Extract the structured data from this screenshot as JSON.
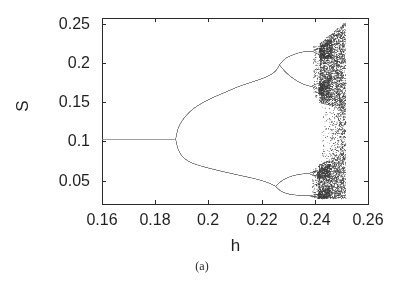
{
  "figure": {
    "caption": "(a)"
  },
  "chart_data": {
    "type": "scatter",
    "subtype": "bifurcation-diagram",
    "title": "",
    "xlabel": "h",
    "ylabel": "S",
    "xlim": [
      0.16,
      0.26
    ],
    "ylim": [
      0.02,
      0.258
    ],
    "grid": false,
    "legend": null,
    "xticks": [
      {
        "value": 0.16,
        "label": "0.16"
      },
      {
        "value": 0.18,
        "label": "0.18"
      },
      {
        "value": 0.2,
        "label": "0.2"
      },
      {
        "value": 0.22,
        "label": "0.22"
      },
      {
        "value": 0.24,
        "label": "0.24"
      },
      {
        "value": 0.26,
        "label": "0.26"
      }
    ],
    "yticks": [
      {
        "value": 0.05,
        "label": "0.05"
      },
      {
        "value": 0.1,
        "label": "0.1"
      },
      {
        "value": 0.15,
        "label": "0.15"
      },
      {
        "value": 0.2,
        "label": "0.2"
      },
      {
        "value": 0.25,
        "label": "0.25"
      }
    ],
    "plot_area_px": {
      "left": 102,
      "top": 18,
      "right": 368,
      "bottom": 204
    },
    "tick_length_px": 4,
    "annotations": {
      "first_bifurcation_h": 0.1877,
      "second_bifurcation_upper_h": 0.2267,
      "second_bifurcation_lower_h": 0.2253,
      "chaos_onset_h": 0.2415,
      "data_end_h": 0.2516,
      "period1_S": 0.103
    },
    "branches": [
      {
        "name": "period-1",
        "points": [
          [
            0.16,
            0.103
          ],
          [
            0.1877,
            0.103
          ]
        ]
      },
      {
        "name": "period-2-upper",
        "points": [
          [
            0.1877,
            0.103
          ],
          [
            0.1883,
            0.114
          ],
          [
            0.1892,
            0.1215
          ],
          [
            0.1905,
            0.1285
          ],
          [
            0.1925,
            0.1365
          ],
          [
            0.1945,
            0.1425
          ],
          [
            0.197,
            0.148
          ],
          [
            0.2,
            0.1535
          ],
          [
            0.2035,
            0.159
          ],
          [
            0.207,
            0.1638
          ],
          [
            0.211,
            0.17
          ],
          [
            0.215,
            0.1745
          ],
          [
            0.219,
            0.179
          ],
          [
            0.2225,
            0.1835
          ],
          [
            0.2245,
            0.1878
          ],
          [
            0.2258,
            0.192
          ],
          [
            0.2267,
            0.198
          ]
        ]
      },
      {
        "name": "period-2-lower",
        "points": [
          [
            0.1877,
            0.103
          ],
          [
            0.1883,
            0.0925
          ],
          [
            0.1892,
            0.0855
          ],
          [
            0.1905,
            0.0795
          ],
          [
            0.1925,
            0.0745
          ],
          [
            0.1943,
            0.0717
          ],
          [
            0.197,
            0.0688
          ],
          [
            0.2,
            0.066
          ],
          [
            0.2035,
            0.063
          ],
          [
            0.207,
            0.0603
          ],
          [
            0.211,
            0.0572
          ],
          [
            0.215,
            0.0543
          ],
          [
            0.219,
            0.0512
          ],
          [
            0.2225,
            0.0473
          ],
          [
            0.2243,
            0.0444
          ],
          [
            0.2253,
            0.0425
          ]
        ]
      },
      {
        "name": "period-4-upper-bubble-top",
        "points": [
          [
            0.2267,
            0.198
          ],
          [
            0.228,
            0.2035
          ],
          [
            0.2295,
            0.2075
          ],
          [
            0.2315,
            0.2105
          ],
          [
            0.2335,
            0.213
          ],
          [
            0.2355,
            0.2147
          ],
          [
            0.2375,
            0.2155
          ],
          [
            0.2392,
            0.2152
          ]
        ]
      },
      {
        "name": "period-4-upper-bubble-bottom",
        "points": [
          [
            0.2267,
            0.198
          ],
          [
            0.228,
            0.1925
          ],
          [
            0.2295,
            0.187
          ],
          [
            0.2315,
            0.1815
          ],
          [
            0.2335,
            0.177
          ],
          [
            0.2355,
            0.1735
          ],
          [
            0.2375,
            0.1712
          ],
          [
            0.2388,
            0.1705
          ]
        ]
      },
      {
        "name": "period-8-uu-up",
        "points": [
          [
            0.2392,
            0.2152
          ],
          [
            0.2408,
            0.218
          ],
          [
            0.2422,
            0.2192
          ]
        ]
      },
      {
        "name": "period-8-uu-down",
        "points": [
          [
            0.2392,
            0.2152
          ],
          [
            0.2408,
            0.2122
          ],
          [
            0.2422,
            0.2105
          ]
        ]
      },
      {
        "name": "period-8-ul-up",
        "points": [
          [
            0.2388,
            0.1705
          ],
          [
            0.2403,
            0.1733
          ],
          [
            0.2418,
            0.1748
          ]
        ]
      },
      {
        "name": "period-8-ul-down",
        "points": [
          [
            0.2388,
            0.1705
          ],
          [
            0.2403,
            0.1678
          ],
          [
            0.2418,
            0.1665
          ]
        ]
      },
      {
        "name": "period-4-lower-bubble-top",
        "points": [
          [
            0.2253,
            0.0425
          ],
          [
            0.2268,
            0.0478
          ],
          [
            0.2285,
            0.0518
          ],
          [
            0.2305,
            0.0548
          ],
          [
            0.2325,
            0.0568
          ],
          [
            0.2345,
            0.0581
          ],
          [
            0.2362,
            0.0588
          ],
          [
            0.2378,
            0.059
          ]
        ]
      },
      {
        "name": "period-4-lower-bubble-bottom",
        "points": [
          [
            0.2253,
            0.0425
          ],
          [
            0.2268,
            0.0372
          ],
          [
            0.2285,
            0.0343
          ],
          [
            0.2305,
            0.0325
          ],
          [
            0.2325,
            0.0315
          ],
          [
            0.2345,
            0.0309
          ],
          [
            0.2362,
            0.0306
          ],
          [
            0.2378,
            0.0305
          ]
        ]
      },
      {
        "name": "period-8-lu-up",
        "points": [
          [
            0.2378,
            0.059
          ],
          [
            0.2393,
            0.0612
          ],
          [
            0.2408,
            0.0623
          ]
        ]
      },
      {
        "name": "period-8-lu-down",
        "points": [
          [
            0.2378,
            0.059
          ],
          [
            0.2393,
            0.0568
          ],
          [
            0.2408,
            0.0557
          ]
        ]
      },
      {
        "name": "period-8-ll-up",
        "points": [
          [
            0.2378,
            0.0305
          ],
          [
            0.2393,
            0.0316
          ],
          [
            0.2408,
            0.0322
          ]
        ]
      },
      {
        "name": "period-8-ll-down",
        "points": [
          [
            0.2378,
            0.0305
          ],
          [
            0.2393,
            0.0296
          ],
          [
            0.2408,
            0.0291
          ]
        ]
      }
    ],
    "chaos_bands": [
      {
        "name": "upper-main",
        "h": [
          0.2418,
          0.2516
        ],
        "s_lo": [
          0.15,
          0.1395
        ],
        "s_hi": [
          0.2255,
          0.2525
        ],
        "points": 2700,
        "ramp": false
      },
      {
        "name": "lower-main",
        "h": [
          0.2415,
          0.2516
        ],
        "s_lo": [
          0.0275,
          0.0262
        ],
        "s_hi": [
          0.07,
          0.086
        ],
        "points": 1500,
        "ramp": false
      },
      {
        "name": "middle-sparse",
        "h": [
          0.2425,
          0.2516
        ],
        "s_lo": [
          0.07,
          0.086
        ],
        "s_hi": [
          0.15,
          0.1395
        ],
        "points": 1050,
        "ramp": true
      },
      {
        "name": "upper-spray",
        "h": [
          0.2395,
          0.2425
        ],
        "s_lo": [
          0.158,
          0.152
        ],
        "s_hi": [
          0.221,
          0.2255
        ],
        "points": 150,
        "ramp": false
      },
      {
        "name": "lower-spray",
        "h": [
          0.239,
          0.242
        ],
        "s_lo": [
          0.0285,
          0.0277
        ],
        "s_hi": [
          0.064,
          0.069
        ],
        "points": 130,
        "ramp": false
      },
      {
        "name": "uu-wedge",
        "h": [
          0.2418,
          0.2465
        ],
        "s_lo": [
          0.205,
          0.2065
        ],
        "s_hi": [
          0.2215,
          0.2335
        ],
        "points": 430,
        "ramp": false
      },
      {
        "name": "ul-wedge",
        "h": [
          0.2415,
          0.2462
        ],
        "s_lo": [
          0.159,
          0.156
        ],
        "s_hi": [
          0.173,
          0.184
        ],
        "points": 390,
        "ramp": false
      },
      {
        "name": "lu-wedge",
        "h": [
          0.241,
          0.2458
        ],
        "s_lo": [
          0.0528,
          0.0545
        ],
        "s_hi": [
          0.0615,
          0.072
        ],
        "points": 340,
        "ramp": false
      },
      {
        "name": "ll-wedge",
        "h": [
          0.241,
          0.2458
        ],
        "s_lo": [
          0.0266,
          0.0268
        ],
        "s_hi": [
          0.033,
          0.042
        ],
        "points": 340,
        "ramp": false
      }
    ],
    "noise_seed": 1337,
    "colors": {
      "background": "#ffffff",
      "axis": "#2a2a2a",
      "branch_line": "#808080",
      "chaos_dots": "#3c3c3c",
      "text": "#1f1f1f"
    }
  }
}
